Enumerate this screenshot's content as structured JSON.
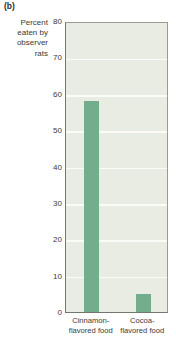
{
  "panel": {
    "label": "(b)"
  },
  "chart_data": {
    "type": "bar",
    "title": "",
    "subtitle": "",
    "xlabel": "",
    "ylabel": "Percent eaten by observer rats",
    "ylabel_lines": [
      "Percent",
      "eaten by",
      "observer",
      "rats"
    ],
    "categories": [
      "Cinnamon-flavored food",
      "Cocoa-flavored food"
    ],
    "category_lines": [
      [
        "Cinnamon-",
        "flavored food"
      ],
      [
        "Cocoa-",
        "flavored food"
      ]
    ],
    "values": [
      58,
      5
    ],
    "ylim": [
      0,
      80
    ],
    "yticks": [
      0,
      10,
      20,
      30,
      40,
      50,
      60,
      70,
      80
    ],
    "ytick_labels": [
      "0",
      "10",
      "20",
      "30",
      "40",
      "50",
      "60",
      "70",
      "80"
    ],
    "grid": true,
    "grid_axis": "y",
    "legend": null,
    "bar_color": "#74ad8c",
    "plot_background": "#e9ece2",
    "gridline_color": "#fbfbf8",
    "axis_color": "#76766f"
  }
}
